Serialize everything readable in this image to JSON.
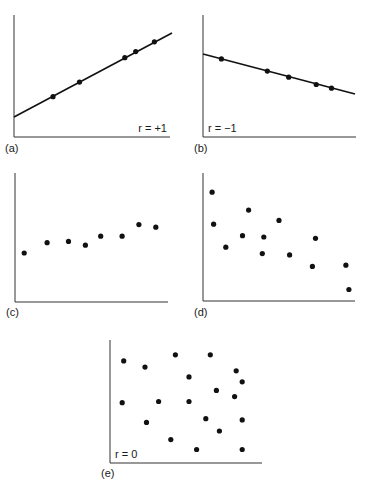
{
  "panels": [
    {
      "id": "a",
      "label": "(a)",
      "annotation": "r = +1"
    },
    {
      "id": "b",
      "label": "(b)",
      "annotation": "r = −1"
    },
    {
      "id": "c",
      "label": "(c)",
      "annotation": ""
    },
    {
      "id": "d",
      "label": "(d)",
      "annotation": ""
    },
    {
      "id": "e",
      "label": "(e)",
      "annotation": "r = 0"
    }
  ],
  "chart_data": [
    {
      "type": "scatter",
      "panel": "(a)",
      "annotation": "r = +1",
      "fit_line": true,
      "points": [
        [
          0.25,
          0.33
        ],
        [
          0.42,
          0.45
        ],
        [
          0.71,
          0.65
        ],
        [
          0.78,
          0.7
        ],
        [
          0.9,
          0.78
        ]
      ],
      "xlabel": "",
      "ylabel": "",
      "grid": false
    },
    {
      "type": "scatter",
      "panel": "(b)",
      "annotation": "r = -1",
      "fit_line": true,
      "points": [
        [
          0.12,
          0.64
        ],
        [
          0.42,
          0.54
        ],
        [
          0.56,
          0.49
        ],
        [
          0.74,
          0.43
        ],
        [
          0.84,
          0.4
        ]
      ],
      "xlabel": "",
      "ylabel": "",
      "grid": false
    },
    {
      "type": "scatter",
      "panel": "(c)",
      "annotation": "",
      "fit_line": false,
      "points": [
        [
          0.06,
          0.38
        ],
        [
          0.21,
          0.46
        ],
        [
          0.35,
          0.47
        ],
        [
          0.46,
          0.44
        ],
        [
          0.56,
          0.51
        ],
        [
          0.7,
          0.51
        ],
        [
          0.81,
          0.6
        ],
        [
          0.92,
          0.58
        ]
      ],
      "xlabel": "",
      "ylabel": "",
      "grid": false
    },
    {
      "type": "scatter",
      "panel": "(d)",
      "annotation": "",
      "fit_line": false,
      "points": [
        [
          0.06,
          0.85
        ],
        [
          0.07,
          0.6
        ],
        [
          0.15,
          0.42
        ],
        [
          0.26,
          0.51
        ],
        [
          0.3,
          0.71
        ],
        [
          0.4,
          0.5
        ],
        [
          0.39,
          0.37
        ],
        [
          0.5,
          0.63
        ],
        [
          0.57,
          0.36
        ],
        [
          0.72,
          0.27
        ],
        [
          0.74,
          0.49
        ],
        [
          0.94,
          0.28
        ],
        [
          0.96,
          0.09
        ]
      ],
      "xlabel": "",
      "ylabel": "",
      "grid": false
    },
    {
      "type": "scatter",
      "panel": "(e)",
      "annotation": "r = 0",
      "fit_line": false,
      "points": [
        [
          0.09,
          0.83
        ],
        [
          0.23,
          0.78
        ],
        [
          0.43,
          0.88
        ],
        [
          0.66,
          0.88
        ],
        [
          0.52,
          0.7
        ],
        [
          0.83,
          0.75
        ],
        [
          0.87,
          0.66
        ],
        [
          0.7,
          0.59
        ],
        [
          0.82,
          0.54
        ],
        [
          0.08,
          0.49
        ],
        [
          0.32,
          0.5
        ],
        [
          0.52,
          0.5
        ],
        [
          0.63,
          0.36
        ],
        [
          0.87,
          0.35
        ],
        [
          0.24,
          0.33
        ],
        [
          0.72,
          0.26
        ],
        [
          0.4,
          0.19
        ],
        [
          0.57,
          0.11
        ],
        [
          0.87,
          0.11
        ]
      ],
      "xlabel": "",
      "ylabel": "",
      "grid": false
    }
  ]
}
